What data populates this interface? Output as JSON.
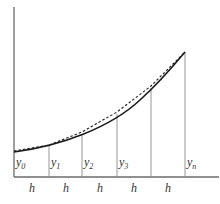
{
  "diagram": {
    "type": "trapezoidal-rule-illustration",
    "colors": {
      "axis": "#6b6b6b",
      "ordinate": "#8a8a8a",
      "curve": "#1a1a1a",
      "chord": "#1a1a1a",
      "label": "#333333"
    },
    "ordinate_labels": [
      {
        "base": "y",
        "sub": "0"
      },
      {
        "base": "y",
        "sub": "1"
      },
      {
        "base": "y",
        "sub": "2"
      },
      {
        "base": "y",
        "sub": "3"
      },
      {
        "base": "y",
        "sub": "n"
      }
    ],
    "interval_labels": [
      "h",
      "h",
      "h",
      "h",
      "h"
    ],
    "curve_style": "solid",
    "chord_style": "dashed"
  }
}
